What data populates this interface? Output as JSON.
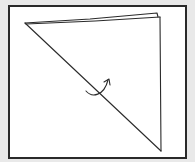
{
  "diagram": {
    "type": "folding-instruction",
    "description": "Square sheet folded along its diagonal into a triangle, with a curved arrow indicating a fold/turn",
    "colors": {
      "background": "#e9e9e9",
      "panel": "#ffffff",
      "stroke": "#2a2a2a"
    },
    "elements": [
      {
        "name": "triangle-folded-paper",
        "points": [
          [
            25,
            23
          ],
          [
            158,
            15
          ],
          [
            161,
            151
          ]
        ]
      },
      {
        "name": "fold-edge-double-line",
        "from": [
          25,
          23
        ],
        "to": [
          158,
          14
        ]
      },
      {
        "name": "diagonal-edge",
        "from": [
          25,
          23
        ],
        "to": [
          161,
          151
        ]
      },
      {
        "name": "curved-fold-arrow",
        "direction": "up-right",
        "center": [
          97,
          88
        ]
      }
    ]
  }
}
